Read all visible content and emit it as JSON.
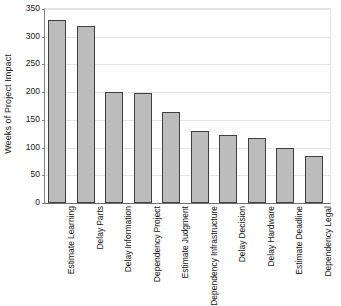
{
  "chart_data": {
    "type": "bar",
    "title": "",
    "xlabel": "",
    "ylabel": "Weeks of Project Impact",
    "ylim": [
      0,
      350
    ],
    "yticks": [
      0,
      50,
      100,
      150,
      200,
      250,
      300,
      350
    ],
    "ytick_labels": [
      "0",
      "50",
      "100",
      "150",
      "200",
      "250",
      "300",
      "350"
    ],
    "grid": "horizontal",
    "legend": "none",
    "bar_fill_color": "#bcbcbc",
    "bar_border_color": "#3f3f3f",
    "categories": [
      "Estimate Learning",
      "Delay Parts",
      "Delay Information",
      "Dependency Project",
      "Estimate Judgment",
      "Dependency Infrastructure",
      "Delay Decision",
      "Delay Hardware",
      "Estimate Deadline",
      "Dependency Legal"
    ],
    "category_lines": [
      [
        "Estimate",
        "Learning"
      ],
      [
        "Delay",
        "Parts"
      ],
      [
        "Delay",
        "Information"
      ],
      [
        "Dependency",
        "Project"
      ],
      [
        "Estimate",
        "Judgment"
      ],
      [
        "Dependency",
        "Infrastructure"
      ],
      [
        "Delay",
        "Decision"
      ],
      [
        "Delay",
        "Hardware"
      ],
      [
        "Estimate",
        "Deadline"
      ],
      [
        "Dependency",
        "Legal"
      ]
    ],
    "values": [
      330,
      320,
      200,
      199,
      165,
      130,
      123,
      117,
      99,
      85
    ]
  }
}
